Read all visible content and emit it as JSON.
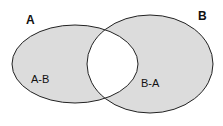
{
  "diagram": {
    "type": "venn",
    "sets": [
      {
        "name": "A",
        "label": "A"
      },
      {
        "name": "B",
        "label": "B"
      }
    ],
    "regions": [
      {
        "id": "a-minus-b",
        "label": "A-B",
        "shaded": true
      },
      {
        "id": "intersection",
        "label": "",
        "shaded": false
      },
      {
        "id": "b-minus-a",
        "label": "B-A",
        "shaded": true
      }
    ],
    "colors": {
      "shade": "#dcdcdc",
      "stroke": "#222222",
      "background": "#ffffff"
    }
  }
}
